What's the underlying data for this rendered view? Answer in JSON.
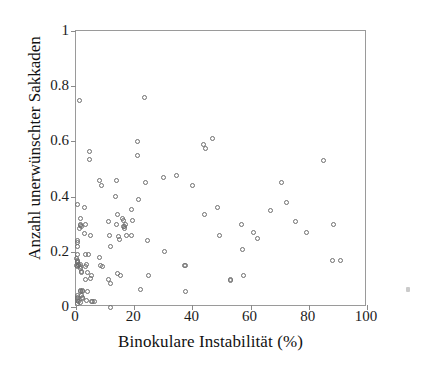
{
  "chart_data": {
    "type": "scatter",
    "title": "",
    "xlabel": "Binokulare Instabilität (%)",
    "ylabel": "Anzahl unerwünschter Sakkaden",
    "xlim": [
      0,
      100
    ],
    "ylim": [
      0,
      1
    ],
    "xticks": [
      0,
      20,
      40,
      60,
      80,
      100
    ],
    "yticks": [
      0,
      0.2,
      0.4,
      0.6,
      0.8,
      1
    ],
    "xticklabels": [
      "0",
      "20",
      "40",
      "60",
      "80",
      "100"
    ],
    "yticklabels": [
      "0",
      "0.2",
      "0.4",
      "0.6",
      "0.8",
      "1"
    ],
    "grid": false,
    "legend": null,
    "marker": "open-circle",
    "marker_color": "#6e6e6e",
    "frame_color": "#9a9a9a",
    "background": "#ffffff",
    "n_points": 118,
    "series": [
      {
        "name": "Probanden",
        "points": [
          [
            0.4,
            0.37
          ],
          [
            0.5,
            0.24
          ],
          [
            0.6,
            0.235
          ],
          [
            0.4,
            0.22
          ],
          [
            0.5,
            0.19
          ],
          [
            0.3,
            0.175
          ],
          [
            0.6,
            0.17
          ],
          [
            0.4,
            0.165
          ],
          [
            0.5,
            0.16
          ],
          [
            0.7,
            0.155
          ],
          [
            0.3,
            0.15
          ],
          [
            0.8,
            0.15
          ],
          [
            0.5,
            0.145
          ],
          [
            0.4,
            0.04
          ],
          [
            0.6,
            0.035
          ],
          [
            0.5,
            0.03
          ],
          [
            0.4,
            0.025
          ],
          [
            0.8,
            0.02
          ],
          [
            0.6,
            0.012
          ],
          [
            1.2,
            0.75
          ],
          [
            1.4,
            0.32
          ],
          [
            1.6,
            0.3
          ],
          [
            1.5,
            0.295
          ],
          [
            1.8,
            0.29
          ],
          [
            1.3,
            0.285
          ],
          [
            1.7,
            0.155
          ],
          [
            1.6,
            0.145
          ],
          [
            1.5,
            0.14
          ],
          [
            2.0,
            0.13
          ],
          [
            1.8,
            0.125
          ],
          [
            1.4,
            0.06
          ],
          [
            1.6,
            0.055
          ],
          [
            2.2,
            0.055
          ],
          [
            2.4,
            0.06
          ],
          [
            1.9,
            0.04
          ],
          [
            2.1,
            0.035
          ],
          [
            2.3,
            0.03
          ],
          [
            1.5,
            0.015
          ],
          [
            2.8,
            0.36
          ],
          [
            3.0,
            0.265
          ],
          [
            3.4,
            0.3
          ],
          [
            3.2,
            0.19
          ],
          [
            3.6,
            0.155
          ],
          [
            3.1,
            0.145
          ],
          [
            3.8,
            0.125
          ],
          [
            3.4,
            0.1
          ],
          [
            4.0,
            0.055
          ],
          [
            3.6,
            0.025
          ],
          [
            4.6,
            0.565
          ],
          [
            4.8,
            0.535
          ],
          [
            5.0,
            0.26
          ],
          [
            4.4,
            0.19
          ],
          [
            5.2,
            0.115
          ],
          [
            4.9,
            0.105
          ],
          [
            5.4,
            0.02
          ],
          [
            5.8,
            0.02
          ],
          [
            6.2,
            0.02
          ],
          [
            8.2,
            0.46
          ],
          [
            8.6,
            0.44
          ],
          [
            8.0,
            0.18
          ],
          [
            8.4,
            0.15
          ],
          [
            9.0,
            0.145
          ],
          [
            11.0,
            0.31
          ],
          [
            11.4,
            0.26
          ],
          [
            11.8,
            0.22
          ],
          [
            11.2,
            0.1
          ],
          [
            12.0,
            0.085
          ],
          [
            12.0,
            0.0
          ],
          [
            13.6,
            0.4
          ],
          [
            13.8,
            0.46
          ],
          [
            14.2,
            0.335
          ],
          [
            14.0,
            0.3
          ],
          [
            14.6,
            0.255
          ],
          [
            15.0,
            0.245
          ],
          [
            14.4,
            0.12
          ],
          [
            15.2,
            0.115
          ],
          [
            16.0,
            0.32
          ],
          [
            16.4,
            0.315
          ],
          [
            16.2,
            0.29
          ],
          [
            16.6,
            0.285
          ],
          [
            16.8,
            0.29
          ],
          [
            17.2,
            0.26
          ],
          [
            17.0,
            0.3
          ],
          [
            19.0,
            0.355
          ],
          [
            19.4,
            0.315
          ],
          [
            19.2,
            0.26
          ],
          [
            21.0,
            0.6
          ],
          [
            21.2,
            0.55
          ],
          [
            21.6,
            0.39
          ],
          [
            22.0,
            0.065
          ],
          [
            23.6,
            0.76
          ],
          [
            24.0,
            0.45
          ],
          [
            24.4,
            0.24
          ],
          [
            24.8,
            0.115
          ],
          [
            30.0,
            0.47
          ],
          [
            30.4,
            0.2
          ],
          [
            34.6,
            0.475
          ],
          [
            37.4,
            0.15
          ],
          [
            37.6,
            0.15
          ],
          [
            37.8,
            0.055
          ],
          [
            40.0,
            0.44
          ],
          [
            43.8,
            0.59
          ],
          [
            44.6,
            0.575
          ],
          [
            44.2,
            0.335
          ],
          [
            47.0,
            0.61
          ],
          [
            48.6,
            0.36
          ],
          [
            49.2,
            0.26
          ],
          [
            53.0,
            0.1
          ],
          [
            53.2,
            0.095
          ],
          [
            56.8,
            0.3
          ],
          [
            57.2,
            0.21
          ],
          [
            57.6,
            0.115
          ],
          [
            61.0,
            0.27
          ],
          [
            62.4,
            0.25
          ],
          [
            66.8,
            0.35
          ],
          [
            70.6,
            0.45
          ],
          [
            72.4,
            0.38
          ],
          [
            75.6,
            0.31
          ],
          [
            79.2,
            0.27
          ],
          [
            85.2,
            0.53
          ],
          [
            88.6,
            0.3
          ],
          [
            88.2,
            0.17
          ],
          [
            91.0,
            0.17
          ]
        ]
      }
    ]
  },
  "figure": {
    "artifact_label": "page-speck"
  }
}
